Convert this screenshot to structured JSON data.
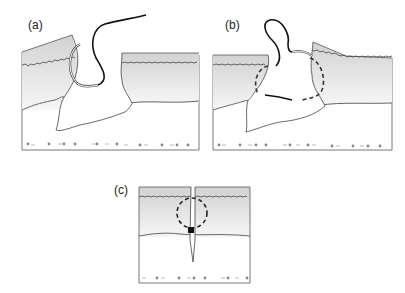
{
  "figure": {
    "panels": [
      {
        "id": "a",
        "label": "(a)",
        "description": "Curved needle with suture entering skin at wound edge; deep gaping wound"
      },
      {
        "id": "b",
        "label": "(b)",
        "description": "Suture passed through both wound edges forming loop (dashed path under tissue)"
      },
      {
        "id": "c",
        "label": "(c)",
        "description": "Wound closed with suture loop (dashed circle) and knot at dermis"
      }
    ],
    "layers": [
      "epidermis",
      "dermis",
      "subcutaneous tissue"
    ],
    "colors": {
      "outline": "#444444",
      "suture": "#111111",
      "dermis_top": "#d6d6d6",
      "dermis_bottom": "#f4f4f4",
      "dots": "#888888"
    }
  }
}
